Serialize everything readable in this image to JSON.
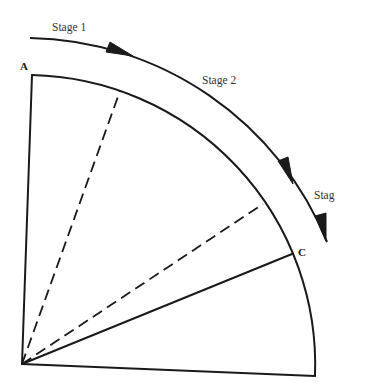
{
  "diagram": {
    "type": "quarter-circle sector with staged arc arrows",
    "colors": {
      "stroke": "#1a1a1a",
      "text": "#333333",
      "background": "#ffffff"
    },
    "points": {
      "A": {
        "label": "A"
      },
      "C": {
        "label": "C"
      }
    },
    "stages": [
      {
        "label": "Stage 1"
      },
      {
        "label": "Stage 2"
      },
      {
        "label": "Stag"
      }
    ],
    "lines": {
      "solid_radii": 3,
      "dashed_radii": 2
    }
  }
}
